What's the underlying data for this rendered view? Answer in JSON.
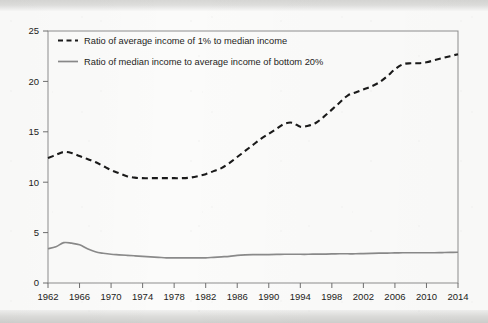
{
  "chart_data": {
    "type": "line",
    "title": "",
    "subtitle": "",
    "xlabel": "",
    "ylabel": "",
    "xlim": [
      1962,
      2014
    ],
    "ylim": [
      0,
      25
    ],
    "grid": false,
    "legend_position": "top-left inside plot",
    "x_ticks": [
      1962,
      1966,
      1970,
      1974,
      1978,
      1982,
      1986,
      1990,
      1994,
      1998,
      2002,
      2006,
      2010,
      2014
    ],
    "y_ticks": [
      0,
      5,
      10,
      15,
      20,
      25
    ],
    "x": [
      1962,
      1963,
      1964,
      1965,
      1966,
      1967,
      1968,
      1969,
      1970,
      1971,
      1972,
      1973,
      1974,
      1975,
      1976,
      1977,
      1978,
      1979,
      1980,
      1981,
      1982,
      1983,
      1984,
      1985,
      1986,
      1987,
      1988,
      1989,
      1990,
      1991,
      1992,
      1993,
      1994,
      1995,
      1996,
      1997,
      1998,
      1999,
      2000,
      2001,
      2002,
      2003,
      2004,
      2005,
      2006,
      2007,
      2008,
      2009,
      2010,
      2011,
      2012,
      2013,
      2014
    ],
    "series": [
      {
        "name": "Ratio of average income of 1% to median income",
        "style": "dashed",
        "color": "#1a1a1a",
        "values": [
          12.4,
          12.7,
          13.0,
          12.9,
          12.6,
          12.3,
          12.0,
          11.6,
          11.2,
          10.9,
          10.6,
          10.45,
          10.4,
          10.4,
          10.4,
          10.4,
          10.4,
          10.4,
          10.45,
          10.6,
          10.8,
          11.1,
          11.4,
          11.9,
          12.5,
          13.1,
          13.7,
          14.3,
          14.8,
          15.3,
          15.8,
          15.9,
          15.5,
          15.6,
          15.9,
          16.5,
          17.2,
          17.9,
          18.6,
          18.9,
          19.2,
          19.5,
          19.9,
          20.5,
          21.2,
          21.7,
          21.8,
          21.8,
          21.9,
          22.1,
          22.3,
          22.5,
          22.7
        ]
      },
      {
        "name": "Ratio of median income to average income of bottom 20%",
        "style": "solid",
        "color": "#8a8a8a",
        "values": [
          3.4,
          3.6,
          4.0,
          3.95,
          3.8,
          3.4,
          3.1,
          2.95,
          2.85,
          2.8,
          2.75,
          2.7,
          2.65,
          2.6,
          2.55,
          2.5,
          2.5,
          2.5,
          2.5,
          2.5,
          2.5,
          2.55,
          2.6,
          2.65,
          2.75,
          2.8,
          2.82,
          2.82,
          2.82,
          2.83,
          2.85,
          2.85,
          2.85,
          2.85,
          2.86,
          2.87,
          2.88,
          2.9,
          2.9,
          2.9,
          2.92,
          2.94,
          2.96,
          2.97,
          2.98,
          3.0,
          3.0,
          3.0,
          3.0,
          3.0,
          3.02,
          3.04,
          3.05
        ]
      }
    ]
  },
  "legend": {
    "entries": [
      {
        "marker": "dashed-line-swatch",
        "label": "Ratio of average income of 1% to median income"
      },
      {
        "marker": "solid-line-swatch",
        "label": "Ratio of median income to average income of bottom 20%"
      }
    ]
  },
  "axes": {
    "y_tick_labels": [
      "25",
      "20",
      "15",
      "10",
      "5",
      "0"
    ],
    "x_tick_labels": [
      "1962",
      "1966",
      "1970",
      "1974",
      "1978",
      "1982",
      "1986",
      "1990",
      "1994",
      "1998",
      "2002",
      "2006",
      "2010",
      "2014"
    ]
  },
  "colors": {
    "series_1": "#1a1a1a",
    "series_2": "#8a8a8a",
    "axis": "#6f6f6f",
    "text": "#1d1d1b",
    "page": "#fbfbfa"
  }
}
